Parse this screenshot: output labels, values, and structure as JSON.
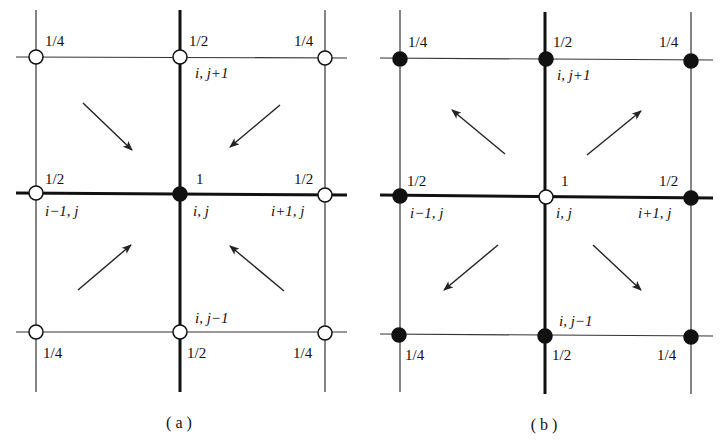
{
  "figure": {
    "type": "stencil-weight-diagram",
    "panels": [
      {
        "id": "a",
        "caption": "( a )",
        "center_node_style": "filled",
        "outer_node_style": "hollow",
        "arrow_direction": "inward",
        "weights": {
          "corner_tl": "1/4",
          "top": "1/2",
          "corner_tr": "1/4",
          "left": "1/2",
          "center": "1",
          "right": "1/2",
          "corner_bl": "1/4",
          "bottom": "1/2",
          "corner_br": "1/4"
        },
        "indices": {
          "top": "i, j+1",
          "left": "i−1, j",
          "center": "i, j",
          "right": "i+1, j",
          "bottom": "i, j−1"
        }
      },
      {
        "id": "b",
        "caption": "( b )",
        "center_node_style": "hollow",
        "outer_node_style": "filled",
        "arrow_direction": "outward",
        "weights": {
          "corner_tl": "1/4",
          "top": "1/2",
          "corner_tr": "1/4",
          "left": "1/2",
          "center": "1",
          "right": "1/2",
          "corner_bl": "1/4",
          "bottom": "1/2",
          "corner_br": "1/4"
        },
        "indices": {
          "top": "i, j+1",
          "left": "i−1, j",
          "center": "i, j",
          "right": "i+1, j",
          "bottom": "i, j−1"
        }
      }
    ]
  }
}
